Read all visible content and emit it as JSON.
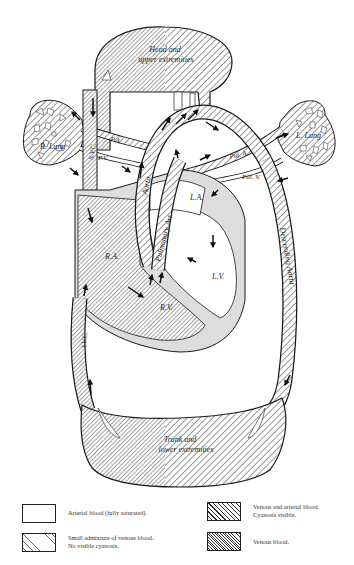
{
  "diagram": {
    "type": "circulation-schematic",
    "colors": {
      "outline": "#1a1a1a",
      "venous_hatch": "#333333",
      "mixed_hatch": "#333333",
      "septum_stipple": "#d8d8d8",
      "background": "#ffffff"
    },
    "labels": {
      "head": "Head and",
      "head2": "upper extremities",
      "r_lung": "R. Lung",
      "l_lung": "L. Lung",
      "svc": "S.V.C.",
      "pa_right": "P.A.",
      "pv_right": "P.V.",
      "aorta": "Aorta",
      "pulmonary_art": "Pulmonary Art.",
      "pul_a": "Pul. A.",
      "pul_v": "Pul. V.",
      "la": "L.A.",
      "lv": "L.V.",
      "ra": "R.A.",
      "rv": "R.V.",
      "descending_aorta": "Descending Aorta",
      "ivc": "I.V.C.",
      "trunk": "Trunk and",
      "trunk2": "lower extremities"
    }
  },
  "legend": {
    "items": [
      {
        "id": "arterial",
        "text": "Arterial blood (fully saturated).",
        "pattern": "blank"
      },
      {
        "id": "small_admixture",
        "text": "Small admixture of venous blood.\nNo visible cyanosis.",
        "pattern": "sparse-dashed-hatch"
      },
      {
        "id": "mixed",
        "text": "Venous and arterial blood.\nCyanosis visible.",
        "pattern": "wide-hatch"
      },
      {
        "id": "venous",
        "text": "Venous blood.",
        "pattern": "dense-hatch"
      }
    ]
  }
}
